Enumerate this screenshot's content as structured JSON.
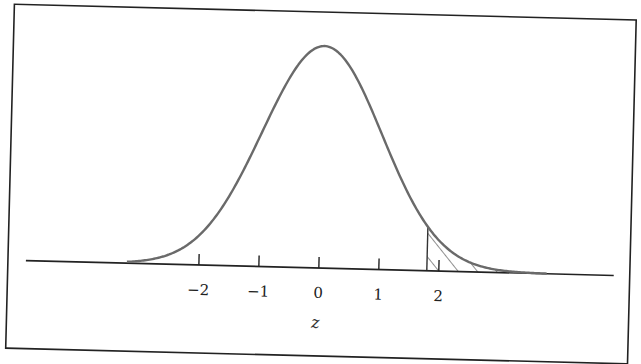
{
  "chart_data": {
    "type": "line",
    "title": "",
    "distribution": {
      "name": "standard normal",
      "mean": 0,
      "sd": 1
    },
    "xlabel": "z",
    "ylabel": "",
    "xlim": [
      -3.9,
      4.9
    ],
    "x_ticks": [
      -2,
      -1,
      0,
      1,
      2
    ],
    "x_tick_labels": [
      "−2",
      "−1",
      "0",
      "1",
      "2"
    ],
    "shaded_region": {
      "from": 1.8,
      "to": "infinity",
      "style": "diagonal hatch",
      "meaning": "upper tail area"
    },
    "grid": false,
    "legend": "none",
    "colors": {
      "curve": "#6a6a6a",
      "axis": "#222222",
      "frame": "#222222",
      "hatch": "#444444"
    }
  }
}
